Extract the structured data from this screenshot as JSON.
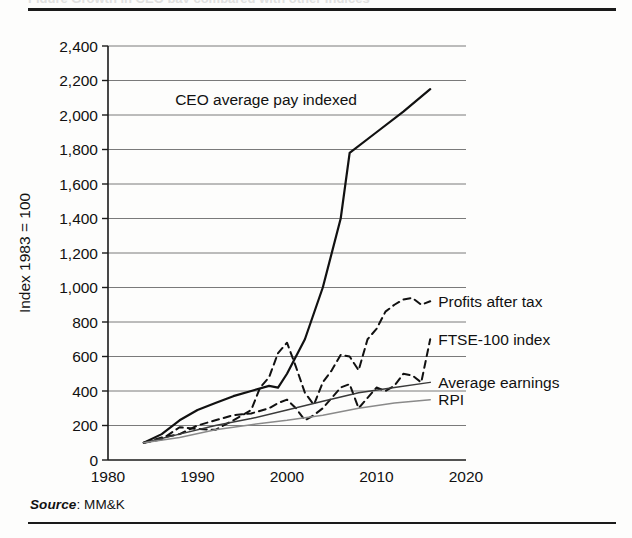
{
  "document": {
    "ghost_caption": "Figure  Growth in CEO pay compared with other indices",
    "source_prefix": "Source",
    "source_separator": ": ",
    "source_value": "MM&K"
  },
  "chart_data": {
    "type": "line",
    "title": "",
    "xlabel": "",
    "ylabel": "Index 1983 = 100",
    "xlim": [
      1980,
      2020
    ],
    "ylim": [
      0,
      2400
    ],
    "xticks": [
      1980,
      1990,
      2000,
      2010,
      2020
    ],
    "xtick_labels": [
      "1980",
      "1990",
      "2000",
      "2010",
      "2020"
    ],
    "yticks": [
      0,
      200,
      400,
      600,
      800,
      1000,
      1200,
      1400,
      1600,
      1800,
      2000,
      2200,
      2400
    ],
    "ytick_labels": [
      "0",
      "200",
      "400",
      "600",
      "800",
      "1,000",
      "1,200",
      "1,400",
      "1,600",
      "1,800",
      "2,000",
      "2,200",
      "2,400"
    ],
    "grid": true,
    "grid_axis": "y",
    "legend_position": "right-inline",
    "series": [
      {
        "name": "CEO average pay indexed",
        "label_placement": "inline-upper-left",
        "style": "solid",
        "width": 2.2,
        "color": "#111111",
        "x": [
          1984,
          1986,
          1988,
          1990,
          1992,
          1994,
          1996,
          1998,
          1999,
          2000,
          2002,
          2004,
          2006,
          2007,
          2010,
          2013,
          2016
        ],
        "values": [
          100,
          150,
          230,
          290,
          330,
          370,
          400,
          430,
          420,
          500,
          700,
          1000,
          1400,
          1780,
          1900,
          2020,
          2150
        ]
      },
      {
        "name": "Profits after tax",
        "label_placement": "right",
        "style": "dashed",
        "width": 2.0,
        "color": "#111111",
        "x": [
          1984,
          1986,
          1988,
          1990,
          1992,
          1994,
          1996,
          1997,
          1998,
          1999,
          2000,
          2001,
          2002,
          2003,
          2004,
          2005,
          2006,
          2007,
          2008,
          2009,
          2010,
          2011,
          2012,
          2013,
          2014,
          2015,
          2016
        ],
        "values": [
          100,
          120,
          190,
          180,
          175,
          230,
          290,
          420,
          480,
          620,
          680,
          540,
          390,
          320,
          450,
          520,
          610,
          600,
          520,
          700,
          760,
          860,
          900,
          930,
          940,
          900,
          920
        ]
      },
      {
        "name": "FTSE-100 index",
        "label_placement": "right",
        "style": "dashed",
        "width": 2.0,
        "color": "#111111",
        "x": [
          1984,
          1986,
          1988,
          1990,
          1992,
          1994,
          1996,
          1998,
          1999,
          2000,
          2001,
          2002,
          2003,
          2004,
          2005,
          2006,
          2007,
          2008,
          2009,
          2010,
          2011,
          2012,
          2013,
          2014,
          2015,
          2016
        ],
        "values": [
          100,
          130,
          150,
          200,
          230,
          260,
          270,
          300,
          330,
          350,
          300,
          230,
          260,
          300,
          360,
          420,
          440,
          300,
          360,
          420,
          400,
          430,
          500,
          490,
          450,
          700
        ]
      },
      {
        "name": "Average earnings",
        "label_placement": "right",
        "style": "solid",
        "width": 1.5,
        "color": "#3a3a3a",
        "x": [
          1984,
          1988,
          1992,
          1996,
          2000,
          2004,
          2008,
          2012,
          2016
        ],
        "values": [
          100,
          150,
          200,
          240,
          290,
          340,
          390,
          420,
          450
        ]
      },
      {
        "name": "RPI",
        "label_placement": "right",
        "style": "solid",
        "width": 1.5,
        "color": "#8a8a8a",
        "x": [
          1984,
          1988,
          1992,
          1996,
          2000,
          2004,
          2008,
          2012,
          2016
        ],
        "values": [
          100,
          130,
          175,
          205,
          230,
          260,
          300,
          330,
          350
        ]
      }
    ],
    "annotations": [
      {
        "text": "CEO average pay indexed",
        "x": 1987.5,
        "y": 2060
      }
    ]
  }
}
